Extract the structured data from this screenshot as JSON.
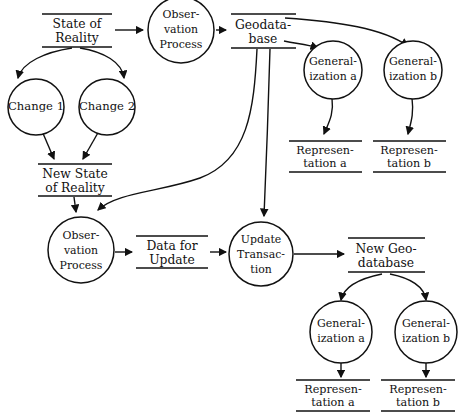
{
  "diagram": {
    "background_color": "#ffffff",
    "stroke_color": "#111111",
    "nodes": {
      "state_of_reality": {
        "line1": "State of",
        "line2": "Reality",
        "shape": "open-box"
      },
      "observation_process_top": {
        "line1": "Obser-",
        "line2": "vation",
        "line3": "Process",
        "shape": "circle"
      },
      "geodatabase": {
        "line1": "Geodata-",
        "line2": "base",
        "shape": "open-box"
      },
      "change_1": {
        "line1": "Change 1",
        "shape": "circle"
      },
      "change_2": {
        "line1": "Change 2",
        "shape": "circle"
      },
      "generalization_a_top": {
        "line1": "General-",
        "line2": "ization a",
        "shape": "circle"
      },
      "generalization_b_top": {
        "line1": "General-",
        "line2": "ization b",
        "shape": "circle"
      },
      "representation_a_top": {
        "line1": "Represen-",
        "line2": "tation a",
        "shape": "open-box"
      },
      "representation_b_top": {
        "line1": "Represen-",
        "line2": "tation b",
        "shape": "open-box"
      },
      "new_state_of_reality": {
        "line1": "New State",
        "line2": "of Reality",
        "shape": "open-box"
      },
      "observation_process_bottom": {
        "line1": "Obser-",
        "line2": "vation",
        "line3": "Process",
        "shape": "circle"
      },
      "data_for_update": {
        "line1": "Data for",
        "line2": "Update",
        "shape": "open-box"
      },
      "update_transaction": {
        "line1": "Update",
        "line2": "Transac-",
        "line3": "tion",
        "shape": "circle"
      },
      "new_geodatabase": {
        "line1": "New Geo-",
        "line2": "database",
        "shape": "open-box"
      },
      "generalization_a_bottom": {
        "line1": "General-",
        "line2": "ization a",
        "shape": "circle"
      },
      "generalization_b_bottom": {
        "line1": "General-",
        "line2": "ization b",
        "shape": "circle"
      },
      "representation_a_bottom": {
        "line1": "Represen-",
        "line2": "tation a",
        "shape": "open-box"
      },
      "representation_b_bottom": {
        "line1": "Represen-",
        "line2": "tation b",
        "shape": "open-box"
      }
    },
    "edges": [
      {
        "from": "state_of_reality",
        "to": "observation_process_top"
      },
      {
        "from": "observation_process_top",
        "to": "geodatabase"
      },
      {
        "from": "state_of_reality",
        "to": "change_1"
      },
      {
        "from": "state_of_reality",
        "to": "change_2"
      },
      {
        "from": "change_1",
        "to": "new_state_of_reality"
      },
      {
        "from": "change_2",
        "to": "new_state_of_reality"
      },
      {
        "from": "geodatabase",
        "to": "generalization_a_top"
      },
      {
        "from": "geodatabase",
        "to": "generalization_b_top"
      },
      {
        "from": "generalization_a_top",
        "to": "representation_a_top"
      },
      {
        "from": "generalization_b_top",
        "to": "representation_b_top"
      },
      {
        "from": "geodatabase",
        "to": "observation_process_bottom"
      },
      {
        "from": "geodatabase",
        "to": "update_transaction"
      },
      {
        "from": "new_state_of_reality",
        "to": "observation_process_bottom"
      },
      {
        "from": "observation_process_bottom",
        "to": "data_for_update"
      },
      {
        "from": "data_for_update",
        "to": "update_transaction"
      },
      {
        "from": "update_transaction",
        "to": "new_geodatabase"
      },
      {
        "from": "new_geodatabase",
        "to": "generalization_a_bottom"
      },
      {
        "from": "new_geodatabase",
        "to": "generalization_b_bottom"
      },
      {
        "from": "generalization_a_bottom",
        "to": "representation_a_bottom"
      },
      {
        "from": "generalization_b_bottom",
        "to": "representation_b_bottom"
      }
    ]
  }
}
